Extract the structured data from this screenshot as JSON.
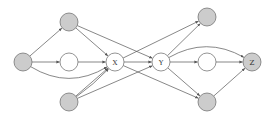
{
  "diagram": {
    "type": "directed-graph",
    "style": {
      "edge_color": "#555555",
      "node_stroke": "#666666",
      "shaded_fill": "#cccccc",
      "open_fill": "#ffffff",
      "radius": 9
    },
    "nodes": [
      {
        "id": "L",
        "label": "",
        "x": 23,
        "y": 62,
        "shaded": true
      },
      {
        "id": "A",
        "label": "",
        "x": 69,
        "y": 22,
        "shaded": true
      },
      {
        "id": "M",
        "label": "",
        "x": 69,
        "y": 62,
        "shaded": false
      },
      {
        "id": "B",
        "label": "",
        "x": 69,
        "y": 102,
        "shaded": true
      },
      {
        "id": "X",
        "label": "X",
        "x": 115,
        "y": 62,
        "shaded": false
      },
      {
        "id": "Y",
        "label": "Y",
        "x": 161,
        "y": 62,
        "shaded": false
      },
      {
        "id": "C",
        "label": "",
        "x": 207,
        "y": 17,
        "shaded": true
      },
      {
        "id": "N",
        "label": "",
        "x": 207,
        "y": 62,
        "shaded": false
      },
      {
        "id": "D",
        "label": "",
        "x": 207,
        "y": 102,
        "shaded": true
      },
      {
        "id": "Z",
        "label": "Z",
        "x": 252,
        "y": 62,
        "shaded": true
      }
    ],
    "edges": [
      {
        "from": "L",
        "to": "A",
        "curve": 0
      },
      {
        "from": "L",
        "to": "M",
        "curve": 0
      },
      {
        "from": "L",
        "to": "X",
        "curve": 28
      },
      {
        "from": "A",
        "to": "X",
        "curve": 0
      },
      {
        "from": "A",
        "to": "Y",
        "curve": 0
      },
      {
        "from": "M",
        "to": "X",
        "curve": 0
      },
      {
        "from": "B",
        "to": "X",
        "curve": 0
      },
      {
        "from": "B",
        "to": "X",
        "curve": 3
      },
      {
        "from": "B",
        "to": "Y",
        "curve": 0
      },
      {
        "from": "X",
        "to": "Y",
        "curve": 0
      },
      {
        "from": "X",
        "to": "C",
        "curve": 0
      },
      {
        "from": "X",
        "to": "D",
        "curve": 0
      },
      {
        "from": "Y",
        "to": "C",
        "curve": 0
      },
      {
        "from": "Y",
        "to": "N",
        "curve": 0
      },
      {
        "from": "Y",
        "to": "Z",
        "curve": -26
      },
      {
        "from": "Y",
        "to": "D",
        "curve": 0
      },
      {
        "from": "N",
        "to": "Z",
        "curve": 0
      },
      {
        "from": "D",
        "to": "Z",
        "curve": 0
      }
    ]
  }
}
